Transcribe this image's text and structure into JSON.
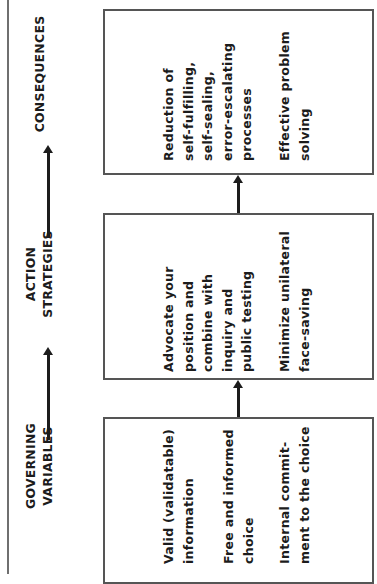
{
  "diagram": {
    "orientation": "rotated 90 degrees counter-clockwise",
    "columns": [
      {
        "header": "GOVERNING\nVARIABLES",
        "items": [
          "Valid (validatable)\ninformation",
          "Free and informed\nchoice",
          "Internal commit-\nment to the choice"
        ]
      },
      {
        "header": "ACTION\nSTRATEGIES",
        "items": [
          "Advocate your\nposition and\ncombine with\ninquiry and\npublic testing",
          "Minimize unilateral\nface-saving"
        ]
      },
      {
        "header": "CONSEQUENCES",
        "items": [
          "Reduction of\nself-fulfilling,\nself-sealing,\nerror-escalating\nprocesses",
          "Effective problem\nsolving"
        ]
      }
    ],
    "colors": {
      "text": "#1c1c1c",
      "box_border": "#555555",
      "rule": "#6f6f6f",
      "background": "#ffffff"
    }
  }
}
